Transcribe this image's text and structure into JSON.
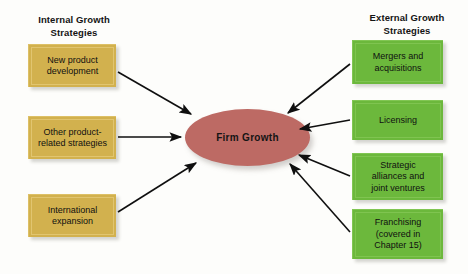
{
  "diagram": {
    "center": {
      "label": "Firm Growth",
      "color": "#bd6a64",
      "shape": "ellipse"
    },
    "left_column": {
      "heading": "Internal Growth\nStrategies",
      "heading_line1": "Internal Growth",
      "heading_line2": "Strategies",
      "color": "#d2b14e",
      "items": [
        {
          "label_line1": "New product",
          "label_line2": "development",
          "label": "New product development"
        },
        {
          "label_line1": "Other product-",
          "label_line2": "related strategies",
          "label": "Other product-related strategies"
        },
        {
          "label_line1": "International",
          "label_line2": "expansion",
          "label": "International expansion"
        }
      ]
    },
    "right_column": {
      "heading": "External Growth\nStrategies",
      "heading_line1": "External Growth",
      "heading_line2": "Strategies",
      "color": "#6cb83c",
      "items": [
        {
          "label_line1": "Mergers and",
          "label_line2": "acquisitions",
          "label": "Mergers and acquisitions"
        },
        {
          "label_line1": "Licensing",
          "label_line2": "",
          "label": "Licensing"
        },
        {
          "label_line1": "Strategic",
          "label_line2": "alliances and",
          "label_line3": "joint ventures",
          "label": "Strategic alliances and joint ventures"
        },
        {
          "label_line1": "Franchising",
          "label_line2": "(covered in",
          "label_line3": "Chapter 15)",
          "label": "Franchising (covered in Chapter 15)"
        }
      ]
    },
    "arrows": {
      "count": 7,
      "direction": "toward-center",
      "color": "#0f0f0f"
    }
  }
}
